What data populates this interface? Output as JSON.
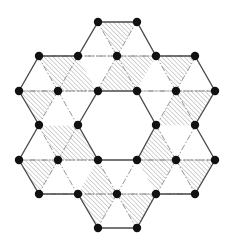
{
  "diagram": {
    "colors": {
      "background": "#ffffff",
      "node": "#111111",
      "solid_edge": "#4a4a4a",
      "dashed_edge": "#8a8a8a",
      "hatch": "#9a9a9a"
    },
    "nodes": [
      [
        98,
        22
      ],
      [
        137,
        22
      ],
      [
        39,
        56
      ],
      [
        78,
        56
      ],
      [
        117,
        56
      ],
      [
        156,
        56
      ],
      [
        195,
        56
      ],
      [
        19,
        91
      ],
      [
        58,
        91
      ],
      [
        98,
        91
      ],
      [
        137,
        91
      ],
      [
        176,
        91
      ],
      [
        215,
        91
      ],
      [
        39,
        125
      ],
      [
        78,
        125
      ],
      [
        156,
        125
      ],
      [
        195,
        125
      ],
      [
        19,
        160
      ],
      [
        58,
        160
      ],
      [
        98,
        160
      ],
      [
        137,
        160
      ],
      [
        176,
        160
      ],
      [
        215,
        160
      ],
      [
        39,
        194
      ],
      [
        78,
        194
      ],
      [
        117,
        194
      ],
      [
        156,
        194
      ],
      [
        195,
        194
      ],
      [
        98,
        228
      ],
      [
        137,
        228
      ]
    ],
    "outer_boundary": [
      [
        98,
        22
      ],
      [
        137,
        22
      ],
      [
        156,
        56
      ],
      [
        195,
        56
      ],
      [
        215,
        91
      ],
      [
        195,
        125
      ],
      [
        215,
        160
      ],
      [
        195,
        194
      ],
      [
        156,
        194
      ],
      [
        137,
        228
      ],
      [
        98,
        228
      ],
      [
        78,
        194
      ],
      [
        39,
        194
      ],
      [
        19,
        160
      ],
      [
        39,
        125
      ],
      [
        19,
        91
      ],
      [
        39,
        56
      ],
      [
        78,
        56
      ]
    ],
    "inner_hexagon": [
      [
        78,
        125
      ],
      [
        98,
        91
      ],
      [
        137,
        91
      ],
      [
        156,
        125
      ],
      [
        137,
        160
      ],
      [
        98,
        160
      ]
    ],
    "hexagons": [
      {
        "center": [
          117,
          56
        ],
        "hatched": [
          "T",
          "LR",
          "B"
        ]
      },
      {
        "center": [
          176,
          91
        ],
        "hatched": [
          "T",
          "LR",
          "B"
        ]
      },
      {
        "center": [
          176,
          160
        ],
        "hatched": [
          "UL",
          "LL",
          "LR"
        ]
      },
      {
        "center": [
          117,
          194
        ],
        "hatched": [
          "UL",
          "LL",
          "LR"
        ]
      },
      {
        "center": [
          58,
          160
        ],
        "hatched": [
          "T",
          "UR",
          "LL"
        ]
      },
      {
        "center": [
          58,
          91
        ],
        "hatched": [
          "T",
          "UR",
          "LL"
        ]
      }
    ]
  }
}
